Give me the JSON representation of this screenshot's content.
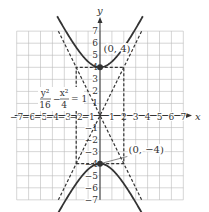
{
  "chart_data": {
    "type": "line",
    "title": "",
    "xlabel": "x",
    "ylabel": "y",
    "xlim": [
      -7,
      7
    ],
    "ylim": [
      -7,
      7
    ],
    "grid": true,
    "x_ticks": [
      -7,
      -6,
      -5,
      -4,
      -3,
      -2,
      -1,
      1,
      2,
      3,
      4,
      5,
      6,
      7
    ],
    "y_ticks": [
      -7,
      -6,
      -5,
      -4,
      -3,
      -2,
      -1,
      1,
      2,
      3,
      4,
      5,
      6,
      7
    ],
    "equation": {
      "num1": "y²",
      "den1": "16",
      "num2": "x²",
      "den2": "4",
      "rhs": "1"
    },
    "series": [
      {
        "name": "upper branch",
        "style": "solid",
        "equation": "y = 4*sqrt(1 + x^2/4)",
        "x_range": [
          -3.6,
          3.6
        ]
      },
      {
        "name": "lower branch",
        "style": "solid",
        "equation": "y = -4*sqrt(1 + x^2/4)",
        "x_range": [
          -3.6,
          3.6
        ]
      },
      {
        "name": "asymptote y=2x",
        "style": "dashed",
        "points": [
          [
            -3.5,
            -7
          ],
          [
            3.5,
            7
          ]
        ]
      },
      {
        "name": "asymptote y=-2x",
        "style": "dashed",
        "points": [
          [
            -3.5,
            7
          ],
          [
            3.5,
            -7
          ]
        ]
      },
      {
        "name": "central rectangle",
        "style": "dashed",
        "points": [
          [
            -2,
            -4
          ],
          [
            2,
            -4
          ],
          [
            2,
            4
          ],
          [
            -2,
            4
          ],
          [
            -2,
            -4
          ]
        ]
      }
    ],
    "annotations": [
      {
        "text": "(0, 4)",
        "point": [
          0,
          4
        ]
      },
      {
        "text": "(0, −4)",
        "point": [
          0,
          -4
        ]
      }
    ],
    "vertices": [
      [
        0,
        4
      ],
      [
        0,
        -4
      ]
    ]
  }
}
